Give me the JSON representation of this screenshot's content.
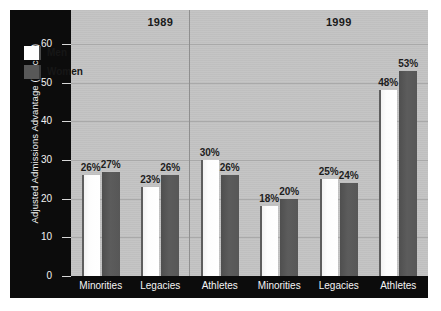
{
  "chart_data": {
    "type": "bar",
    "title": "",
    "xlabel": "",
    "ylabel": "Adjusted Admissions Advantage (percent)",
    "ylim": [
      0,
      60
    ],
    "yticks": [
      0,
      10,
      20,
      30,
      40,
      50,
      60
    ],
    "grid": true,
    "legend_position": "top-left",
    "panels": [
      {
        "year": "1989",
        "categories": [
          "Minorities",
          "Legacies",
          "Athletes"
        ],
        "series": [
          {
            "name": "Men",
            "values": [
              26,
              23,
              30
            ],
            "labels": [
              "26%",
              "23%",
              "30%"
            ]
          },
          {
            "name": "Women",
            "values": [
              27,
              26,
              26
            ],
            "labels": [
              "27%",
              "26%",
              "26%"
            ]
          }
        ]
      },
      {
        "year": "1999",
        "categories": [
          "Minorities",
          "Legacies",
          "Athletes"
        ],
        "series": [
          {
            "name": "Men",
            "values": [
              18,
              25,
              48
            ],
            "labels": [
              "18%",
              "25%",
              "48%"
            ]
          },
          {
            "name": "Women",
            "values": [
              20,
              24,
              53
            ],
            "labels": [
              "20%",
              "24%",
              "53%"
            ]
          }
        ]
      }
    ],
    "legend": [
      {
        "label": "Men",
        "color": "#ffffff"
      },
      {
        "label": "Women",
        "color": "#585858"
      }
    ],
    "colors": {
      "plot_background": "#c3c3c3",
      "panel_background": "#0c0c0c",
      "gridline": "#a9a9a9",
      "men_bar": "#ffffff",
      "women_bar": "#585858",
      "axis_text": "#f2f2f2",
      "label_text": "#1d1d1d"
    }
  }
}
